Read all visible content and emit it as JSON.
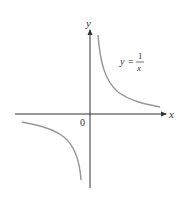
{
  "figure": {
    "type": "function-graph",
    "function": "y = 1/x",
    "equation_label": {
      "lhs": "y",
      "eq": "=",
      "numerator": "1",
      "denominator": "x"
    },
    "axes": {
      "x_label": "x",
      "y_label": "y",
      "origin_label": "0"
    },
    "colors": {
      "axis": "#333333",
      "curve": "#999999",
      "text": "#333333"
    }
  }
}
